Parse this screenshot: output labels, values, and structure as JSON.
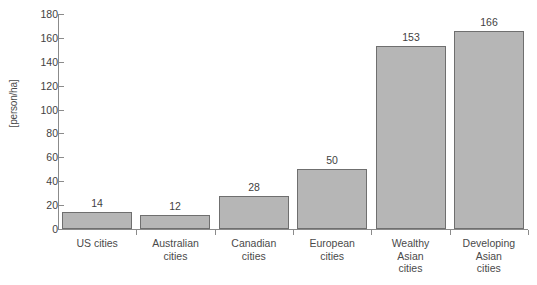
{
  "chart_data": {
    "type": "bar",
    "title": "",
    "xlabel": "",
    "ylabel": "[person/ha]",
    "ylim": [
      0,
      180
    ],
    "ytick_step": 20,
    "grid": false,
    "legend": null,
    "bar_fill_color": "#b6b6b6",
    "bar_border_color": "#6f6f6f",
    "axis_color": "#8b8b8b",
    "categories": [
      "US cities",
      "Australian cities",
      "Canadian cities",
      "European cities",
      "Wealthy Asian cities",
      "Developing Asian cities"
    ],
    "category_lines": [
      [
        "US cities"
      ],
      [
        "Australian",
        "cities"
      ],
      [
        "Canadian",
        "cities"
      ],
      [
        "European",
        "cities"
      ],
      [
        "Wealthy",
        "Asian",
        "cities"
      ],
      [
        "Developing",
        "Asian",
        "cities"
      ]
    ],
    "values": [
      14,
      12,
      28,
      50,
      153,
      166
    ],
    "value_labels": [
      "14",
      "12",
      "28",
      "50",
      "153",
      "166"
    ],
    "ytick_labels": [
      "0",
      "20",
      "40",
      "60",
      "80",
      "100",
      "120",
      "140",
      "160",
      "180"
    ],
    "yticks": [
      0,
      20,
      40,
      60,
      80,
      100,
      120,
      140,
      160,
      180
    ]
  }
}
